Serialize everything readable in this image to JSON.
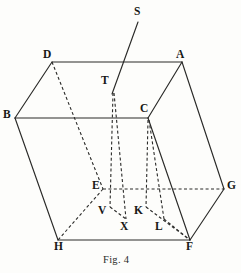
{
  "figure": {
    "caption": "Fig. 4",
    "caption_x": 103,
    "caption_y": 254,
    "width": 241,
    "height": 273,
    "background_color": "#fdfdfb",
    "ink_color": "#2a2a28"
  },
  "labels": [
    {
      "id": "D",
      "text": "D",
      "x": 43,
      "y": 49,
      "point_x": 52,
      "point_y": 62
    },
    {
      "id": "A",
      "text": "A",
      "x": 176,
      "y": 49,
      "point_x": 182,
      "point_y": 62
    },
    {
      "id": "S",
      "text": "S",
      "x": 134,
      "y": 6,
      "point_x": 138,
      "point_y": 22
    },
    {
      "id": "T",
      "text": "T",
      "x": 101,
      "y": 75,
      "point_x": 113,
      "point_y": 92
    },
    {
      "id": "B",
      "text": "B",
      "x": 3,
      "y": 109,
      "point_x": 15,
      "point_y": 118
    },
    {
      "id": "C",
      "text": "C",
      "x": 140,
      "y": 103,
      "point_x": 148,
      "point_y": 118
    },
    {
      "id": "E",
      "text": "E",
      "x": 92,
      "y": 180,
      "point_x": 103,
      "point_y": 189
    },
    {
      "id": "G",
      "text": "G",
      "x": 227,
      "y": 180,
      "point_x": 224,
      "point_y": 189
    },
    {
      "id": "V",
      "text": "V",
      "x": 98,
      "y": 205,
      "point_x": 110,
      "point_y": 205
    },
    {
      "id": "K",
      "text": "K",
      "x": 134,
      "y": 205,
      "point_x": 146,
      "point_y": 205
    },
    {
      "id": "X",
      "text": "X",
      "x": 120,
      "y": 221,
      "point_x": 126,
      "point_y": 218
    },
    {
      "id": "L",
      "text": "L",
      "x": 155,
      "y": 221,
      "point_x": 163,
      "point_y": 218
    },
    {
      "id": "H",
      "text": "H",
      "x": 54,
      "y": 241,
      "point_x": 58,
      "point_y": 240
    },
    {
      "id": "F",
      "text": "F",
      "x": 186,
      "y": 241,
      "point_x": 190,
      "point_y": 240
    }
  ],
  "edges_solid": [
    {
      "name": "edge-D-A",
      "from": "D",
      "to": "A",
      "x1": 52,
      "y1": 62,
      "x2": 182,
      "y2": 62
    },
    {
      "name": "edge-D-B",
      "from": "D",
      "to": "B",
      "x1": 52,
      "y1": 62,
      "x2": 15,
      "y2": 118
    },
    {
      "name": "edge-B-C",
      "from": "B",
      "to": "C",
      "x1": 15,
      "y1": 118,
      "x2": 148,
      "y2": 118
    },
    {
      "name": "edge-A-C",
      "from": "A",
      "to": "C",
      "x1": 182,
      "y1": 62,
      "x2": 148,
      "y2": 118
    },
    {
      "name": "edge-A-G",
      "from": "A",
      "to": "G",
      "x1": 182,
      "y1": 62,
      "x2": 224,
      "y2": 189
    },
    {
      "name": "edge-B-H",
      "from": "B",
      "to": "H",
      "x1": 15,
      "y1": 118,
      "x2": 58,
      "y2": 240
    },
    {
      "name": "edge-H-F",
      "from": "H",
      "to": "F",
      "x1": 58,
      "y1": 240,
      "x2": 190,
      "y2": 240
    },
    {
      "name": "edge-G-F",
      "from": "G",
      "to": "F",
      "x1": 224,
      "y1": 189,
      "x2": 190,
      "y2": 240
    },
    {
      "name": "edge-C-F",
      "from": "C",
      "to": "F",
      "x1": 148,
      "y1": 118,
      "x2": 190,
      "y2": 240
    }
  ],
  "edges_dashed": [
    {
      "name": "edge-D-E",
      "from": "D",
      "to": "E",
      "x1": 52,
      "y1": 62,
      "x2": 103,
      "y2": 189
    },
    {
      "name": "edge-E-G",
      "from": "E",
      "to": "G",
      "x1": 103,
      "y1": 189,
      "x2": 224,
      "y2": 189
    },
    {
      "name": "edge-E-H",
      "from": "E",
      "to": "H",
      "x1": 103,
      "y1": 189,
      "x2": 58,
      "y2": 240
    },
    {
      "name": "edge-T-V",
      "from": "T",
      "to": "V",
      "x1": 113,
      "y1": 93,
      "x2": 110,
      "y2": 207
    },
    {
      "name": "edge-T-X",
      "from": "T",
      "to": "X",
      "x1": 114,
      "y1": 93,
      "x2": 126,
      "y2": 219
    },
    {
      "name": "edge-V-X",
      "from": "V",
      "to": "X",
      "x1": 110,
      "y1": 207,
      "x2": 126,
      "y2": 219
    },
    {
      "name": "edge-C-K",
      "from": "C",
      "to": "K",
      "x1": 148,
      "y1": 120,
      "x2": 146,
      "y2": 207
    },
    {
      "name": "edge-C-L",
      "from": "C",
      "to": "L",
      "x1": 149,
      "y1": 120,
      "x2": 164,
      "y2": 219
    },
    {
      "name": "edge-K-F",
      "from": "K",
      "to": "F",
      "x1": 146,
      "y1": 207,
      "x2": 190,
      "y2": 240
    },
    {
      "name": "edge-L-F",
      "from": "L",
      "to": "F",
      "x1": 164,
      "y1": 219,
      "x2": 190,
      "y2": 240
    }
  ],
  "rays": [
    {
      "name": "ray-S-T",
      "from": "S",
      "to": "T",
      "x1": 138,
      "y1": 22,
      "x2": 112,
      "y2": 94
    }
  ]
}
